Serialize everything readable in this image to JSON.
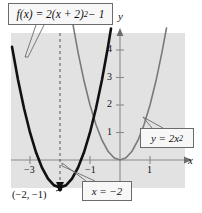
{
  "figure": {
    "background": "#ffffff",
    "plot_background": "#e2e2e2"
  },
  "labels": {
    "fx_box": "f(x) = 2(x + 2)2 − 1",
    "fx_box_base": "f(x) = 2(x + 2)",
    "fx_box_exp": "2",
    "fx_box_tail": " − 1",
    "y2x2_base": "y = 2x",
    "y2x2_exp": "2",
    "axis_x": "x",
    "axis_y": "y",
    "vertex": "(−2, −1)",
    "axis_of_symmetry": "x = −2"
  },
  "axes": {
    "x_ticks": [
      "−3",
      "−1",
      "1"
    ],
    "x_tick_values": [
      -3,
      -1,
      1
    ],
    "y_ticks": [
      "1",
      "2",
      "3",
      "4"
    ],
    "y_tick_values": [
      1,
      2,
      3,
      4
    ],
    "origin_px": [
      120,
      160
    ],
    "unit_px_x": 30,
    "unit_px_y": 27.5,
    "x_range": [
      -3.6,
      2.1
    ],
    "y_range": [
      -1.2,
      4.7
    ]
  },
  "chart_data": {
    "type": "line",
    "xlabel": "x",
    "ylabel": "y",
    "xlim": [
      -3.6,
      2.1
    ],
    "ylim": [
      -1.2,
      4.7
    ],
    "grid": false,
    "legend": "callout-boxes",
    "xticks": [
      -3,
      -1,
      1
    ],
    "yticks": [
      1,
      2,
      3,
      4
    ],
    "series": [
      {
        "name": "f(x) = 2(x + 2)^2 - 1",
        "color": "#111111",
        "style": "solid-thick",
        "equation": "y = 2*(x+2)^2 - 1",
        "vertex": [
          -2,
          -1
        ],
        "points": [
          {
            "x": -3.6,
            "y": 4.12
          },
          {
            "x": -3.4,
            "y": 2.92
          },
          {
            "x": -3.2,
            "y": 1.88
          },
          {
            "x": -3.0,
            "y": 1.0
          },
          {
            "x": -2.8,
            "y": 0.28
          },
          {
            "x": -2.6,
            "y": -0.28
          },
          {
            "x": -2.4,
            "y": -0.68
          },
          {
            "x": -2.2,
            "y": -0.92
          },
          {
            "x": -2.0,
            "y": -1.0
          },
          {
            "x": -1.8,
            "y": -0.92
          },
          {
            "x": -1.6,
            "y": -0.68
          },
          {
            "x": -1.4,
            "y": -0.28
          },
          {
            "x": -1.2,
            "y": 0.28
          },
          {
            "x": -1.0,
            "y": 1.0
          },
          {
            "x": -0.8,
            "y": 1.88
          },
          {
            "x": -0.6,
            "y": 2.92
          },
          {
            "x": -0.4,
            "y": 4.12
          },
          {
            "x": -0.3,
            "y": 4.78
          }
        ]
      },
      {
        "name": "y = 2x^2",
        "color": "#7a7a7a",
        "style": "solid-thin",
        "equation": "y = 2*x^2",
        "vertex": [
          0,
          0
        ],
        "points": [
          {
            "x": -1.6,
            "y": 5.12
          },
          {
            "x": -1.4,
            "y": 3.92
          },
          {
            "x": -1.2,
            "y": 2.88
          },
          {
            "x": -1.0,
            "y": 2.0
          },
          {
            "x": -0.8,
            "y": 1.28
          },
          {
            "x": -0.6,
            "y": 0.72
          },
          {
            "x": -0.4,
            "y": 0.32
          },
          {
            "x": -0.2,
            "y": 0.08
          },
          {
            "x": 0.0,
            "y": 0.0
          },
          {
            "x": 0.2,
            "y": 0.08
          },
          {
            "x": 0.4,
            "y": 0.32
          },
          {
            "x": 0.6,
            "y": 0.72
          },
          {
            "x": 0.8,
            "y": 1.28
          },
          {
            "x": 1.0,
            "y": 2.0
          },
          {
            "x": 1.2,
            "y": 2.88
          },
          {
            "x": 1.4,
            "y": 3.92
          },
          {
            "x": 1.55,
            "y": 4.8
          }
        ]
      }
    ],
    "annotations": [
      {
        "name": "axis-of-symmetry",
        "text": "x = −2",
        "type": "dashed-vertical",
        "x": -2
      },
      {
        "name": "vertex-point",
        "text": "(−2, −1)",
        "type": "point",
        "x": -2,
        "y": -1
      }
    ]
  }
}
